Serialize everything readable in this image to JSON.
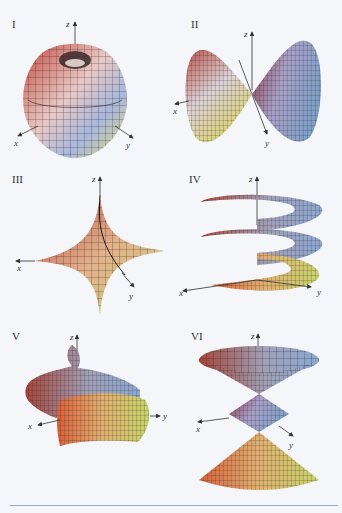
{
  "figure": {
    "panels": [
      {
        "label": "I",
        "surface": "apple-torus (dimpled sphere)",
        "axes": [
          "z",
          "x",
          "y"
        ]
      },
      {
        "label": "II",
        "surface": "double-lobe (bowtie) surface",
        "axes": [
          "z",
          "x",
          "y"
        ]
      },
      {
        "label": "III",
        "surface": "astroidal ellipsoid (star)",
        "axes": [
          "z",
          "x",
          "y"
        ]
      },
      {
        "label": "IV",
        "surface": "helicoid ribbon (spiral ramp)",
        "axes": [
          "z",
          "x",
          "y"
        ]
      },
      {
        "label": "V",
        "surface": "spiral tube",
        "axes": [
          "z",
          "x",
          "y"
        ]
      },
      {
        "label": "VI",
        "surface": "stacked double cones",
        "axes": [
          "z",
          "x",
          "y"
        ]
      }
    ],
    "colors": {
      "red": "#d9604c",
      "blue": "#8fa3d6",
      "yellow": "#e3d96a",
      "mesh": "#2a2220",
      "rule": "#9aa9c4"
    }
  }
}
